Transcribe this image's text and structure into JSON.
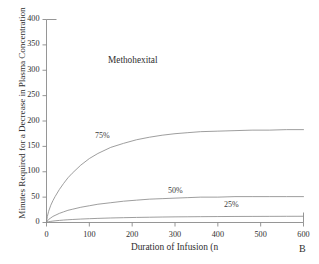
{
  "chart_data": {
    "type": "line",
    "title": "Methohexital",
    "panel_letter": "B",
    "xlabel": "Duration of Infusion (n",
    "ylabel": "Minutes Required for a Decrease in Plasma Concentration",
    "xlim": [
      0,
      600
    ],
    "ylim": [
      0,
      400
    ],
    "xticks": [
      0,
      100,
      200,
      300,
      400,
      500,
      600
    ],
    "yticks": [
      0,
      50,
      100,
      150,
      200,
      250,
      300,
      350,
      400
    ],
    "grid": false,
    "legend_position": "inline-labels",
    "line_color": "#8c8c8c",
    "axis_color": "#8a8a8a",
    "series": [
      {
        "name": "75%",
        "label": "75%",
        "label_x": 95,
        "label_y": 131,
        "x": [
          0,
          2,
          5,
          10,
          15,
          20,
          30,
          40,
          50,
          60,
          80,
          100,
          120,
          150,
          180,
          210,
          240,
          270,
          300,
          330,
          360,
          400,
          440,
          480,
          520,
          560,
          600
        ],
        "values": [
          0,
          12,
          22,
          34,
          43,
          51,
          65,
          77,
          88,
          97,
          113,
          126,
          136,
          148,
          156,
          163,
          168,
          172,
          175,
          177,
          179,
          180,
          181,
          182,
          182,
          183,
          183
        ]
      },
      {
        "name": "50%",
        "label": "50%",
        "label_x": 168,
        "label_y": 186,
        "x": [
          0,
          2,
          5,
          10,
          15,
          20,
          30,
          40,
          50,
          60,
          80,
          100,
          120,
          150,
          180,
          210,
          240,
          270,
          300,
          330,
          360,
          400,
          440,
          480,
          520,
          560,
          600
        ],
        "values": [
          0,
          3,
          6,
          9,
          12,
          14,
          18,
          21,
          24,
          26,
          30,
          33,
          36,
          39,
          42,
          44,
          46,
          47,
          48,
          49,
          50,
          50,
          51,
          51,
          51,
          51,
          51
        ]
      },
      {
        "name": "25%",
        "label": "25%",
        "label_x": 224,
        "label_y": 200,
        "x": [
          0,
          2,
          5,
          10,
          15,
          20,
          30,
          40,
          50,
          60,
          80,
          100,
          120,
          150,
          180,
          210,
          240,
          270,
          300,
          330,
          360,
          400,
          440,
          480,
          520,
          560,
          600
        ],
        "values": [
          0,
          1,
          1.5,
          2.2,
          2.8,
          3.3,
          4.1,
          4.8,
          5.4,
          5.9,
          6.8,
          7.5,
          8.1,
          8.9,
          9.5,
          10.0,
          10.4,
          10.8,
          11.1,
          11.3,
          11.5,
          11.7,
          11.9,
          12.0,
          12.1,
          12.2,
          12.3
        ]
      }
    ]
  }
}
